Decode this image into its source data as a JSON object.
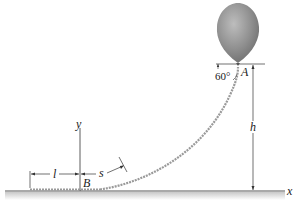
{
  "diagram": {
    "labels": {
      "point_a": "A",
      "point_b": "B",
      "axis_x": "x",
      "axis_y": "y",
      "height": "h",
      "length_l": "l",
      "arc_s": "s",
      "angle": "60°"
    },
    "colors": {
      "balloon": "#8f8f8f",
      "cord": "#9a9a9a",
      "ground": "#555555",
      "line": "#333333"
    }
  }
}
